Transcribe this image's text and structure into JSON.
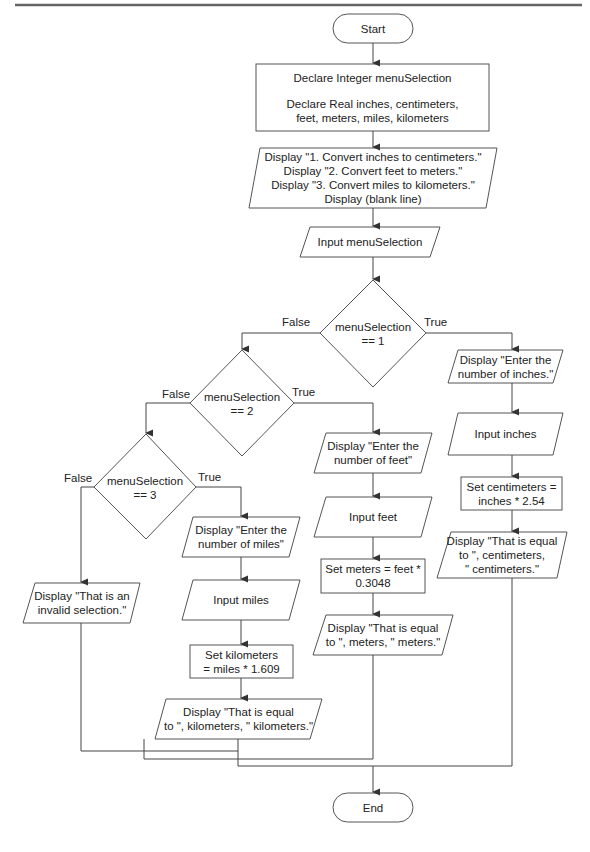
{
  "flowchart": {
    "start": "Start",
    "end": "End",
    "declare": {
      "line1": "Declare Integer menuSelection",
      "line2": "Declare Real inches, centimeters,\nfeet, meters, miles, kilometers"
    },
    "menu_display": "Display \"1. Convert inches to centimeters.\"\nDisplay \"2. Convert feet to meters.\"\nDisplay \"3. Convert miles to kilometers.\"\nDisplay (blank line)",
    "input_menu": "Input menuSelection",
    "decision1": {
      "text": "menuSelection\n== 1",
      "true_label": "True",
      "false_label": "False"
    },
    "decision2": {
      "text": "menuSelection\n== 2",
      "true_label": "True",
      "false_label": "False"
    },
    "decision3": {
      "text": "menuSelection\n== 3",
      "true_label": "True",
      "false_label": "False"
    },
    "inches_branch": {
      "prompt": "Display \"Enter the\nnumber of inches.\"",
      "input": "Input inches",
      "calc": "Set centimeters =\ninches * 2.54",
      "output": "Display \"That is equal\nto \", centimeters,\n\" centimeters.\""
    },
    "feet_branch": {
      "prompt": "Display \"Enter the\nnumber of feet\"",
      "input": "Input feet",
      "calc": "Set meters = feet *\n0.3048",
      "output": "Display \"That is equal\nto \", meters, \" meters.\""
    },
    "miles_branch": {
      "prompt": "Display \"Enter the\nnumber of miles\"",
      "input": "Input miles",
      "calc": "Set kilometers\n= miles * 1.609",
      "output": "Display \"That is equal\nto \", kilometers, \" kilometers.\""
    },
    "invalid_branch": {
      "output": "Display \"That is an\ninvalid selection.\""
    }
  },
  "colors": {
    "stroke": "#555555",
    "rule": "#666666",
    "text": "#222222",
    "background": "#ffffff"
  }
}
